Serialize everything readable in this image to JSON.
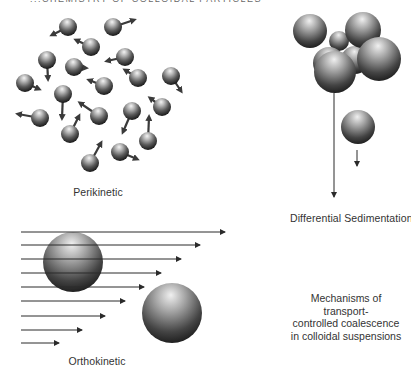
{
  "header": {
    "cropped_title": "...CHEMISTRY OF COLLOIDAL PARTICLES"
  },
  "panels": {
    "perikinetic": {
      "label": "Perikinetic",
      "particles": [
        {
          "cx": 68,
          "cy": 27,
          "r": 9,
          "ax": 52,
          "ay": 35
        },
        {
          "cx": 113,
          "cy": 27,
          "r": 9,
          "ax": 134,
          "ay": 20
        },
        {
          "cx": 91,
          "cy": 47,
          "r": 9,
          "ax": 76,
          "ay": 40
        },
        {
          "cx": 125,
          "cy": 57,
          "r": 9,
          "ax": 107,
          "ay": 61
        },
        {
          "cx": 47,
          "cy": 60,
          "r": 9,
          "ax": 48,
          "ay": 79
        },
        {
          "cx": 74,
          "cy": 67,
          "r": 9,
          "ax": 86,
          "ay": 68
        },
        {
          "cx": 138,
          "cy": 78,
          "r": 9,
          "ax": 125,
          "ay": 70
        },
        {
          "cx": 104,
          "cy": 86,
          "r": 9,
          "ax": 89,
          "ay": 80
        },
        {
          "cx": 171,
          "cy": 76,
          "r": 9,
          "ax": 181,
          "ay": 91
        },
        {
          "cx": 25,
          "cy": 83,
          "r": 9,
          "ax": 39,
          "ay": 89
        },
        {
          "cx": 63,
          "cy": 94,
          "r": 9,
          "ax": 62,
          "ay": 118
        },
        {
          "cx": 162,
          "cy": 107,
          "r": 9,
          "ax": 150,
          "ay": 98
        },
        {
          "cx": 40,
          "cy": 118,
          "r": 9,
          "ax": 18,
          "ay": 114
        },
        {
          "cx": 99,
          "cy": 116,
          "r": 9,
          "ax": 80,
          "ay": 103
        },
        {
          "cx": 132,
          "cy": 111,
          "r": 9,
          "ax": 123,
          "ay": 132
        },
        {
          "cx": 70,
          "cy": 134,
          "r": 9,
          "ax": 79,
          "ay": 116
        },
        {
          "cx": 148,
          "cy": 141,
          "r": 9,
          "ax": 149,
          "ay": 117
        },
        {
          "cx": 120,
          "cy": 152,
          "r": 9,
          "ax": 137,
          "ay": 159
        },
        {
          "cx": 90,
          "cy": 163,
          "r": 9,
          "ax": 101,
          "ay": 143
        }
      ]
    },
    "differential_sedimentation": {
      "label": "Differential Sedimentation",
      "cluster": [
        {
          "cx": 339,
          "cy": 41,
          "r": 10
        },
        {
          "cx": 355,
          "cy": 60,
          "r": 14
        },
        {
          "cx": 329,
          "cy": 63,
          "r": 16
        },
        {
          "cx": 310,
          "cy": 31,
          "r": 17
        },
        {
          "cx": 363,
          "cy": 30,
          "r": 18
        },
        {
          "cx": 379,
          "cy": 59,
          "r": 22
        },
        {
          "cx": 335,
          "cy": 72,
          "r": 21
        }
      ],
      "cluster_arrow": {
        "x": 334,
        "y1": 93,
        "y2": 197
      },
      "small_particle": {
        "cx": 358,
        "cy": 127,
        "r": 17
      },
      "small_arrow": {
        "x": 357,
        "y1": 150,
        "y2": 166
      }
    },
    "orthokinetic": {
      "label": "Orthokinetic",
      "flow_arrows": [
        {
          "y": 232,
          "x1": 21,
          "x2": 225
        },
        {
          "y": 245,
          "x1": 21,
          "x2": 200
        },
        {
          "y": 259,
          "x1": 21,
          "x2": 181
        },
        {
          "y": 273,
          "x1": 21,
          "x2": 161
        },
        {
          "y": 287,
          "x1": 21,
          "x2": 144
        },
        {
          "y": 301,
          "x1": 21,
          "x2": 125
        },
        {
          "y": 316,
          "x1": 21,
          "x2": 105
        },
        {
          "y": 330,
          "x1": 21,
          "x2": 82
        },
        {
          "y": 343,
          "x1": 21,
          "x2": 59
        }
      ],
      "particles": [
        {
          "cx": 73,
          "cy": 262,
          "r": 30
        },
        {
          "cx": 172,
          "cy": 313,
          "r": 30
        }
      ]
    }
  },
  "caption": {
    "line1": "Mechanisms of transport-",
    "line2": "controlled coalescence",
    "line3": "in colloidal suspensions"
  },
  "colors": {
    "background": "#ffffff",
    "sphere_highlight": "#f2f2f2",
    "sphere_mid": "#8a8a8a",
    "sphere_dark": "#1a1a1a",
    "arrow": "#2a2a2a",
    "text": "#333333"
  }
}
